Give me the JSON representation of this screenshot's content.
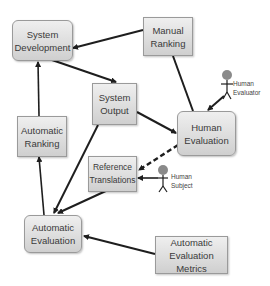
{
  "diagram": {
    "title": "",
    "nodes": [
      {
        "id": "system_development",
        "label": "System\nDevelopment",
        "shape": "rounded"
      },
      {
        "id": "manual_ranking",
        "label": "Manual\nRanking",
        "shape": "rect"
      },
      {
        "id": "system_output",
        "label": "System\nOutput",
        "shape": "rect"
      },
      {
        "id": "human_evaluation",
        "label": "Human\nEvaluation",
        "shape": "rounded"
      },
      {
        "id": "automatic_ranking",
        "label": "Automatic\nRanking",
        "shape": "rect"
      },
      {
        "id": "reference_translations",
        "label": "Reference\nTranslations",
        "shape": "rect"
      },
      {
        "id": "automatic_evaluation",
        "label": "Automatic\nEvaluation",
        "shape": "rounded"
      },
      {
        "id": "automatic_evaluation_metrics",
        "label": "Automatic\nEvaluation Metrics",
        "shape": "rect"
      }
    ],
    "actors": [
      {
        "id": "human_evaluator",
        "label": "Human\nEvaluator",
        "icon": "stick-figure-icon"
      },
      {
        "id": "human_subject",
        "label": "Human\nSubject",
        "icon": "stick-figure-icon"
      }
    ],
    "edges": [
      {
        "from": "manual_ranking",
        "to": "system_development",
        "style": "solid"
      },
      {
        "from": "system_development",
        "to": "system_output",
        "style": "solid"
      },
      {
        "from": "human_evaluation",
        "to": "manual_ranking",
        "style": "solid"
      },
      {
        "from": "system_output",
        "to": "human_evaluation",
        "style": "solid"
      },
      {
        "from": "human_evaluator",
        "to": "human_evaluation",
        "style": "solid"
      },
      {
        "from": "automatic_ranking",
        "to": "system_development",
        "style": "solid"
      },
      {
        "from": "automatic_evaluation",
        "to": "automatic_ranking",
        "style": "solid"
      },
      {
        "from": "system_output",
        "to": "automatic_evaluation",
        "style": "solid"
      },
      {
        "from": "reference_translations",
        "to": "automatic_evaluation",
        "style": "solid"
      },
      {
        "from": "human_evaluation",
        "to": "reference_translations",
        "style": "dashed"
      },
      {
        "from": "human_subject",
        "to": "reference_translations",
        "style": "solid"
      },
      {
        "from": "automatic_evaluation_metrics",
        "to": "automatic_evaluation",
        "style": "solid"
      }
    ],
    "colors": {
      "box_top": "#efefef",
      "box_bottom": "#cfcfcf",
      "box_border": "#9a9a9a",
      "arrow": "#1e1e1e",
      "figure_head": "#8a8a8a"
    }
  }
}
